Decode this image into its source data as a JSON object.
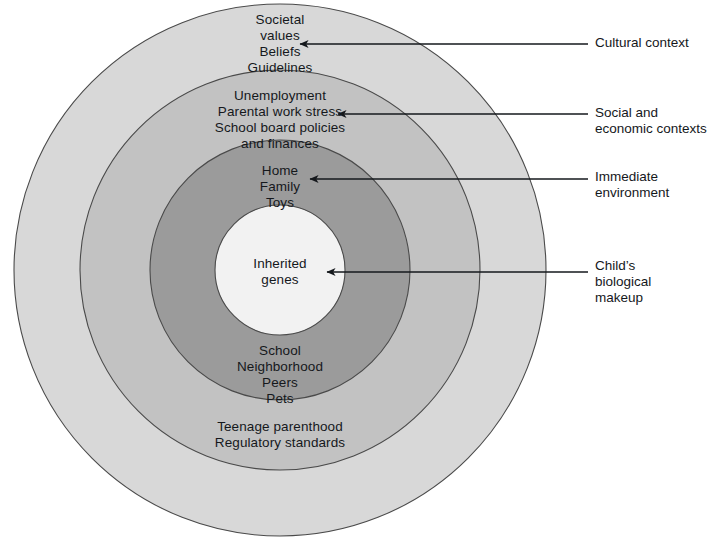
{
  "diagram": {
    "center": {
      "x": 280,
      "y": 270
    },
    "background_color": "#ffffff",
    "text_color": "#15181c",
    "stroke_color": "#4a4a4a",
    "rings": [
      {
        "id": "cultural-context",
        "name": "Cultural context",
        "radius": 266,
        "fill": "#d8d8d8",
        "items_top": [
          "Societal",
          "values",
          "Beliefs",
          "Guidelines"
        ],
        "items_bottom": []
      },
      {
        "id": "social-economic-contexts",
        "name": "Social and economic contexts",
        "radius": 200,
        "fill": "#c2c2c2",
        "items_top": [
          "Unemployment",
          "Parental work stress",
          "School board policies",
          "and finances"
        ],
        "items_bottom": [
          "Teenage parenthood",
          "Regulatory standards"
        ]
      },
      {
        "id": "immediate-environment",
        "name": "Immediate environment",
        "radius": 130,
        "fill": "#9b9b9b",
        "items_top": [
          "Home",
          "Family",
          "Toys"
        ],
        "items_bottom": [
          "School",
          "Neighborhood",
          "Peers",
          "Pets"
        ]
      },
      {
        "id": "childs-biological-makeup",
        "name": "Child's biological makeup",
        "radius": 65,
        "fill": "#f2f2f2",
        "items_top": [
          "Inherited",
          "genes"
        ],
        "items_bottom": []
      }
    ],
    "ring_text": {
      "cultural": {
        "lines": [
          "Societal",
          "values",
          "Beliefs",
          "Guidelines"
        ]
      },
      "social": {
        "lines": [
          "Unemployment",
          "Parental work stress",
          "School board policies",
          "and finances"
        ]
      },
      "immediate": {
        "lines": [
          "Home",
          "Family",
          "Toys"
        ]
      },
      "genes": {
        "lines": [
          "Inherited",
          "genes"
        ]
      },
      "immediate_lower": {
        "lines": [
          "School",
          "Neighborhood",
          "Peers",
          "Pets"
        ]
      },
      "social_lower": {
        "lines": [
          "Teenage parenthood",
          "Regulatory standards"
        ]
      }
    },
    "callouts": [
      {
        "id": "cultural-context",
        "lines": [
          "Cultural context"
        ],
        "arrow": {
          "x1": 588,
          "y1": 44,
          "x2": 300,
          "y2": 44
        }
      },
      {
        "id": "social-and-economic-contexts",
        "lines": [
          "Social and",
          "economic contexts"
        ],
        "arrow": {
          "x1": 588,
          "y1": 114,
          "x2": 338,
          "y2": 114
        }
      },
      {
        "id": "immediate-environment",
        "lines": [
          "Immediate",
          "environment"
        ],
        "arrow": {
          "x1": 588,
          "y1": 179,
          "x2": 310,
          "y2": 179
        }
      },
      {
        "id": "childs-biological-makeup",
        "lines": [
          "Child’s",
          "biological",
          "makeup"
        ],
        "arrow": {
          "x1": 588,
          "y1": 272,
          "x2": 327,
          "y2": 272
        }
      }
    ]
  }
}
